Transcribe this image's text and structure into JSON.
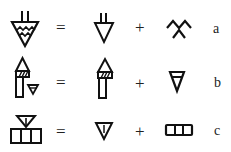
{
  "diagram": {
    "type": "glyph-decomposition",
    "rows": [
      {
        "id": "a",
        "label": "a",
        "equals": "=",
        "plus": "+",
        "composite": "triangle-with-stem-and-water-lines",
        "part1": "triangle-with-stem",
        "part2": "double-chevron-water"
      },
      {
        "id": "b",
        "label": "b",
        "equals": "=",
        "plus": "+",
        "composite": "arrow-pillar-with-small-triangle",
        "part1": "arrow-pillar-hatched",
        "part2": "triangle-with-bar"
      },
      {
        "id": "c",
        "label": "c",
        "equals": "=",
        "plus": "+",
        "composite": "triangle-over-three-cells",
        "part1": "triangle-with-center-line",
        "part2": "three-cell-box"
      }
    ]
  },
  "colors": {
    "ink": "#111111",
    "background": "#ffffff"
  }
}
